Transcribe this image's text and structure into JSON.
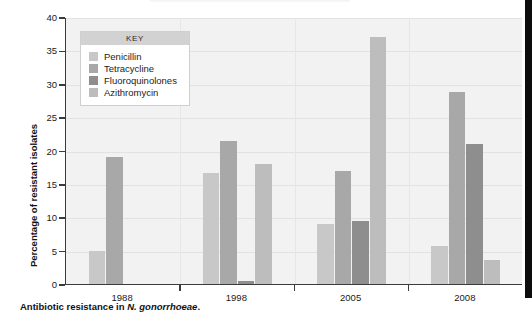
{
  "figure": {
    "caption_prefix": "Antibiotic resistance in ",
    "caption_italic": "N. gonorrhoeae",
    "caption_suffix": "."
  },
  "legend": {
    "title": "KEY",
    "entries": [
      {
        "label": "Penicillin",
        "color": "#c8c8c8"
      },
      {
        "label": "Tetracycline",
        "color": "#a8a8a8"
      },
      {
        "label": "Fluoroquinolones",
        "color": "#8e8e8e"
      },
      {
        "label": "Azithromycin",
        "color": "#bdbdbd"
      }
    ]
  },
  "chart_data": {
    "type": "bar",
    "title": "",
    "xlabel": "",
    "ylabel": "Percentage of resistant isolates",
    "categories": [
      "1988",
      "1998",
      "2005",
      "2008"
    ],
    "ylim": [
      0,
      40
    ],
    "yticks": [
      0,
      5,
      10,
      15,
      20,
      25,
      30,
      35,
      40
    ],
    "grid": true,
    "legend_position": "inside-top-left",
    "series": [
      {
        "name": "Penicillin",
        "color": "#c8c8c8",
        "values": [
          5.0,
          16.7,
          9.0,
          5.7
        ]
      },
      {
        "name": "Tetracycline",
        "color": "#a8a8a8",
        "values": [
          19.0,
          21.4,
          17.0,
          28.8
        ]
      },
      {
        "name": "Fluoroquinolones",
        "color": "#8e8e8e",
        "values": [
          0.0,
          0.5,
          9.4,
          21.0
        ]
      },
      {
        "name": "Azithromycin",
        "color": "#bdbdbd",
        "values": [
          0.0,
          18.0,
          37.0,
          3.6
        ]
      }
    ]
  }
}
